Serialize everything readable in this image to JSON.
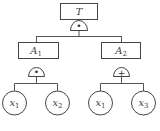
{
  "diagram": {
    "type": "fault-tree",
    "top_event": {
      "label": "T"
    },
    "top_gate": {
      "type": "AND",
      "symbol": "•"
    },
    "intermediate_events": [
      {
        "label": "A",
        "subscript": "1",
        "gate": {
          "type": "AND",
          "symbol": "•"
        }
      },
      {
        "label": "A",
        "subscript": "2",
        "gate": {
          "type": "OR",
          "symbol": "+"
        }
      }
    ],
    "basic_events": [
      {
        "label": "x",
        "subscript": "1",
        "parent": "A1"
      },
      {
        "label": "x",
        "subscript": "2",
        "parent": "A1"
      },
      {
        "label": "x",
        "subscript": "1",
        "parent": "A2"
      },
      {
        "label": "x",
        "subscript": "3",
        "parent": "A2"
      }
    ]
  }
}
